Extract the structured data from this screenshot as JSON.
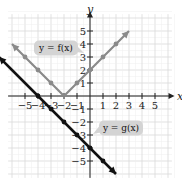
{
  "chart_data": {
    "type": "line",
    "title": "",
    "xlabel": "x",
    "ylabel": "y",
    "xlim": [
      -6,
      6
    ],
    "ylim": [
      -6,
      6
    ],
    "grid": true,
    "x_ticks": [
      "-5",
      "-4",
      "-3",
      "-2",
      "-1",
      "1",
      "2",
      "3",
      "4",
      "5"
    ],
    "y_ticks": [
      "5",
      "4",
      "3",
      "2",
      "1",
      "-1",
      "-2",
      "-3",
      "-4",
      "-5"
    ],
    "series": [
      {
        "name": "y = f(x)",
        "color": "#8a8a8a",
        "points": [
          [
            -6,
            4
          ],
          [
            -5,
            3
          ],
          [
            -4,
            2
          ],
          [
            -3,
            1
          ],
          [
            -2,
            0
          ],
          [
            -1,
            1
          ],
          [
            0,
            2
          ],
          [
            1,
            3
          ],
          [
            2,
            4
          ],
          [
            3,
            5
          ]
        ],
        "marked_points": [
          [
            -5,
            3
          ],
          [
            -4,
            2
          ],
          [
            -3,
            1
          ],
          [
            -1,
            1
          ],
          [
            0,
            2
          ],
          [
            1,
            3
          ],
          [
            2,
            4
          ]
        ]
      },
      {
        "name": "y = g(x)",
        "color": "#111111",
        "points": [
          [
            -7,
            3
          ],
          [
            -6,
            2
          ],
          [
            -5,
            1
          ],
          [
            -4,
            0
          ],
          [
            -3,
            -1
          ],
          [
            -2,
            -2
          ],
          [
            -1,
            -3
          ],
          [
            0,
            -4
          ],
          [
            1,
            -5
          ],
          [
            2,
            -6
          ]
        ],
        "marked_points": [
          [
            -4,
            0
          ],
          [
            -3,
            -1
          ],
          [
            -2,
            -2
          ],
          [
            -1,
            -3
          ],
          [
            0,
            -4
          ],
          [
            1,
            -5
          ]
        ]
      }
    ],
    "annotations": [
      {
        "text": "y = f(x)",
        "x": -3,
        "y": 3.5
      },
      {
        "text": "y = g(x)",
        "x": 2,
        "y": -2.5
      }
    ]
  },
  "labels": {
    "f_label": "y = f(x)",
    "g_label": "y = g(x)",
    "x_axis": "x",
    "y_axis": "y"
  }
}
